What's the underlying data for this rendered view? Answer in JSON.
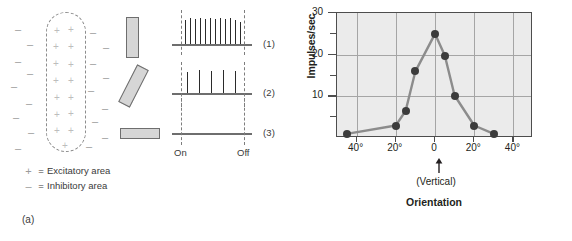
{
  "figure": {
    "panel_a": {
      "caption": "(a)",
      "receptive_field": {
        "excitatory_symbol": "+",
        "inhibitory_symbol": "–"
      },
      "stimuli": [
        {
          "name": "vertical-bar",
          "orientation": "vertical"
        },
        {
          "name": "oblique-bar",
          "orientation": "oblique"
        },
        {
          "name": "horizontal-bar",
          "orientation": "horizontal"
        }
      ],
      "traces": [
        {
          "label": "(1)",
          "spike_count": 12,
          "response": "strong"
        },
        {
          "label": "(2)",
          "spike_count": 5,
          "response": "moderate"
        },
        {
          "label": "(3)",
          "spike_count": 0,
          "response": "none"
        }
      ],
      "stimulus_markers": {
        "on": "On",
        "off": "Off"
      },
      "legend": [
        {
          "key": "+",
          "equals": "=",
          "text": "Excitatory area"
        },
        {
          "key": "–",
          "equals": "=",
          "text": "Inhibitory area"
        }
      ]
    },
    "panel_b": {
      "caption": "(b)",
      "vertical_note": "(Vertical)"
    }
  },
  "chart_data": {
    "type": "line",
    "title": "",
    "xlabel": "Orientation",
    "ylabel": "Impulses/sec",
    "x": [
      -45,
      -20,
      -15,
      -10,
      0,
      5,
      10,
      20,
      30
    ],
    "values": [
      1,
      3,
      6.5,
      16,
      25,
      19.8,
      10.2,
      3,
      1
    ],
    "xtick_values": [
      -40,
      -20,
      0,
      20,
      40
    ],
    "xtick_labels": [
      "40°",
      "20°",
      "0",
      "20°",
      "40°"
    ],
    "ytick_labels": [
      "10",
      "20",
      "30"
    ],
    "ytick_values": [
      10,
      20,
      30
    ],
    "yminor_ticks": [
      5,
      15,
      25
    ],
    "xlim": [
      -50,
      50
    ],
    "ylim": [
      0,
      30
    ],
    "grid": true,
    "legend": "none",
    "marker": "filled-circle",
    "line_color": "#8c8c8c",
    "marker_color": "#3c3c3c",
    "plot_background": "#ebebeb",
    "annotation": "(Vertical)"
  }
}
